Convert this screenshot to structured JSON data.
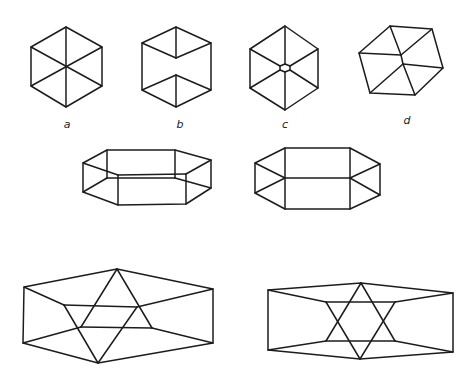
{
  "line_color": "#1c1c1c",
  "background": "#ffffff",
  "figures": [
    {
      "id": "a",
      "label": "a",
      "label_pos": [
        67,
        128
      ],
      "description": "hexagon with three diagonals through center (cube seen along body diagonal)",
      "polygon": [
        [
          66,
          27
        ],
        [
          102,
          47
        ],
        [
          102,
          86
        ],
        [
          66,
          107
        ],
        [
          31,
          86
        ],
        [
          31,
          47
        ]
      ],
      "lines": [
        [
          [
            66,
            27
          ],
          [
            66,
            107
          ]
        ],
        [
          [
            31,
            47
          ],
          [
            102,
            86
          ]
        ],
        [
          [
            102,
            47
          ],
          [
            31,
            86
          ]
        ]
      ]
    },
    {
      "id": "b",
      "label": "b",
      "label_pos": [
        180,
        128
      ],
      "description": "hexagon cube with inner Y and inverted Y separated",
      "polygon": [
        [
          176,
          27
        ],
        [
          211,
          43
        ],
        [
          211,
          90
        ],
        [
          176,
          107
        ],
        [
          142,
          90
        ],
        [
          142,
          43
        ]
      ],
      "lines": [
        [
          [
            176,
            27
          ],
          [
            176,
            58
          ]
        ],
        [
          [
            142,
            43
          ],
          [
            176,
            58
          ]
        ],
        [
          [
            211,
            43
          ],
          [
            176,
            58
          ]
        ],
        [
          [
            176,
            75
          ],
          [
            176,
            107
          ]
        ],
        [
          [
            142,
            90
          ],
          [
            176,
            75
          ]
        ],
        [
          [
            211,
            90
          ],
          [
            176,
            75
          ]
        ]
      ]
    },
    {
      "id": "c",
      "label": "c",
      "label_pos": [
        285,
        128
      ],
      "description": "hexagon with diagonals meeting at small central hexagon",
      "polygon": [
        [
          285,
          26
        ],
        [
          318,
          49
        ],
        [
          318,
          88
        ],
        [
          285,
          110
        ],
        [
          250,
          88
        ],
        [
          250,
          49
        ]
      ],
      "lines": [
        [
          [
            285,
            26
          ],
          [
            285,
            64
          ]
        ],
        [
          [
            285,
            72
          ],
          [
            285,
            110
          ]
        ],
        [
          [
            250,
            49
          ],
          [
            280,
            66
          ]
        ],
        [
          [
            290,
            70
          ],
          [
            318,
            88
          ]
        ],
        [
          [
            318,
            49
          ],
          [
            290,
            66
          ]
        ],
        [
          [
            280,
            70
          ],
          [
            250,
            88
          ]
        ]
      ],
      "inner_polygon": [
        [
          285,
          64
        ],
        [
          290,
          66
        ],
        [
          290,
          70
        ],
        [
          285,
          72
        ],
        [
          280,
          70
        ],
        [
          280,
          66
        ]
      ]
    },
    {
      "id": "d",
      "label": "d",
      "label_pos": [
        407,
        124
      ],
      "description": "tilted cube with two inner vertices",
      "polygon": [
        [
          390,
          26
        ],
        [
          432,
          29
        ],
        [
          443,
          68
        ],
        [
          415,
          95
        ],
        [
          370,
          93
        ],
        [
          359,
          53
        ]
      ],
      "lines": [
        [
          [
            390,
            26
          ],
          [
            401,
            55
          ]
        ],
        [
          [
            359,
            53
          ],
          [
            401,
            55
          ]
        ],
        [
          [
            432,
            29
          ],
          [
            401,
            55
          ]
        ],
        [
          [
            403,
            64
          ],
          [
            443,
            68
          ]
        ],
        [
          [
            403,
            64
          ],
          [
            370,
            93
          ]
        ],
        [
          [
            403,
            64
          ],
          [
            415,
            95
          ]
        ],
        [
          [
            401,
            55
          ],
          [
            403,
            64
          ]
        ]
      ]
    },
    {
      "id": "prism-left",
      "label": "",
      "description": "hexagonal prism viewed obliquely",
      "polygon": [
        [
          107,
          150
        ],
        [
          175,
          150
        ],
        [
          211,
          160
        ],
        [
          211,
          188
        ],
        [
          186,
          204
        ],
        [
          118,
          205
        ],
        [
          83,
          192
        ],
        [
          83,
          163
        ]
      ],
      "lines": [
        [
          [
            107,
            150
          ],
          [
            107,
            178
          ]
        ],
        [
          [
            175,
            150
          ],
          [
            175,
            178
          ]
        ],
        [
          [
            107,
            178
          ],
          [
            175,
            178
          ]
        ],
        [
          [
            118,
            175
          ],
          [
            186,
            174
          ]
        ],
        [
          [
            118,
            175
          ],
          [
            118,
            205
          ]
        ],
        [
          [
            186,
            174
          ],
          [
            186,
            204
          ]
        ],
        [
          [
            83,
            163
          ],
          [
            118,
            175
          ]
        ],
        [
          [
            211,
            160
          ],
          [
            186,
            174
          ]
        ],
        [
          [
            83,
            192
          ],
          [
            107,
            178
          ]
        ],
        [
          [
            175,
            178
          ],
          [
            211,
            188
          ]
        ]
      ]
    },
    {
      "id": "prism-right",
      "label": "",
      "description": "hexagonal prism viewed from the side",
      "polygon": [
        [
          285,
          148
        ],
        [
          350,
          148
        ],
        [
          380,
          164
        ],
        [
          380,
          195
        ],
        [
          350,
          209
        ],
        [
          285,
          209
        ],
        [
          255,
          193
        ],
        [
          255,
          163
        ]
      ],
      "lines": [
        [
          [
            285,
            148
          ],
          [
            285,
            209
          ]
        ],
        [
          [
            350,
            148
          ],
          [
            350,
            209
          ]
        ],
        [
          [
            285,
            178
          ],
          [
            350,
            178
          ]
        ],
        [
          [
            255,
            163
          ],
          [
            285,
            178
          ]
        ],
        [
          [
            255,
            193
          ],
          [
            285,
            178
          ]
        ],
        [
          [
            380,
            164
          ],
          [
            350,
            178
          ]
        ],
        [
          [
            380,
            195
          ],
          [
            350,
            178
          ]
        ]
      ]
    },
    {
      "id": "star-left",
      "label": "",
      "description": "flattened figure with skewed star of David inside",
      "polygon": [
        [
          117,
          269
        ],
        [
          213,
          289
        ],
        [
          213,
          343
        ],
        [
          98,
          363
        ],
        [
          23,
          343
        ],
        [
          24,
          287
        ]
      ],
      "lines": [
        [
          [
            24,
            287
          ],
          [
            64,
            305
          ]
        ],
        [
          [
            64,
            305
          ],
          [
            137,
            307
          ]
        ],
        [
          [
            137,
            307
          ],
          [
            213,
            289
          ]
        ],
        [
          [
            117,
            269
          ],
          [
            81,
            327
          ]
        ],
        [
          [
            117,
            269
          ],
          [
            152,
            328
          ]
        ],
        [
          [
            81,
            327
          ],
          [
            152,
            328
          ]
        ],
        [
          [
            23,
            343
          ],
          [
            81,
            327
          ]
        ],
        [
          [
            152,
            328
          ],
          [
            213,
            343
          ]
        ],
        [
          [
            64,
            305
          ],
          [
            98,
            363
          ]
        ],
        [
          [
            137,
            307
          ],
          [
            98,
            363
          ]
        ]
      ]
    },
    {
      "id": "star-right",
      "label": "",
      "description": "flattened figure with symmetric star of David inside",
      "polygon": [
        [
          361,
          283
        ],
        [
          453,
          293
        ],
        [
          453,
          352
        ],
        [
          360,
          359
        ],
        [
          268,
          350
        ],
        [
          268,
          290
        ]
      ],
      "lines": [
        [
          [
            268,
            290
          ],
          [
            326,
            302
          ]
        ],
        [
          [
            326,
            302
          ],
          [
            395,
            302
          ]
        ],
        [
          [
            395,
            302
          ],
          [
            453,
            293
          ]
        ],
        [
          [
            268,
            350
          ],
          [
            326,
            341
          ]
        ],
        [
          [
            326,
            341
          ],
          [
            395,
            341
          ]
        ],
        [
          [
            395,
            341
          ],
          [
            453,
            352
          ]
        ],
        [
          [
            361,
            283
          ],
          [
            326,
            341
          ]
        ],
        [
          [
            361,
            283
          ],
          [
            395,
            341
          ]
        ],
        [
          [
            360,
            359
          ],
          [
            326,
            302
          ]
        ],
        [
          [
            360,
            359
          ],
          [
            395,
            302
          ]
        ]
      ]
    }
  ]
}
